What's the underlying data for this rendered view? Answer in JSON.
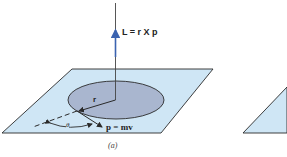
{
  "figure": {
    "caption": "(a)",
    "labels": {
      "angular_momentum": "L = r X p",
      "radius": "r",
      "momentum": "p = mv",
      "angle": "θ"
    },
    "colors": {
      "plane_fill": "#cfe6f5",
      "disk_fill": "#a9b6cf",
      "line": "#2a2a2a",
      "vector_blue": "#3b63b0"
    }
  }
}
